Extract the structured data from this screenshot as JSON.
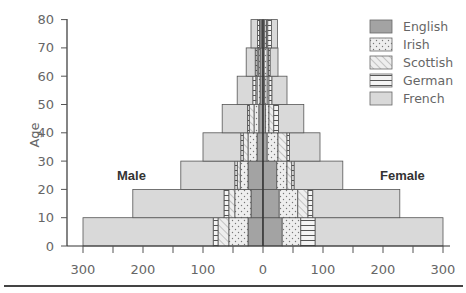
{
  "chart_data": {
    "type": "bar",
    "subtype": "population-pyramid (stacked horizontal bars)",
    "title": "",
    "ylabel": "Age",
    "xlabel": "",
    "side_labels": {
      "left": "Male",
      "right": "Female"
    },
    "categories": [
      "0-10",
      "10-20",
      "20-30",
      "30-40",
      "40-50",
      "50-60",
      "60-70",
      "70-80"
    ],
    "y_ticks": [
      0,
      10,
      20,
      30,
      40,
      50,
      60,
      70,
      80
    ],
    "x_ticks": [
      300,
      200,
      100,
      0,
      100,
      200,
      300
    ],
    "xlim": [
      -300,
      300
    ],
    "ylim": [
      0,
      80
    ],
    "grid": false,
    "legend_position": "top-right",
    "stack_order_from_center": [
      "English",
      "Irish",
      "Scottish",
      "German",
      "French"
    ],
    "series": [
      {
        "name": "English",
        "pattern": "solid-dark",
        "color": "#a0a0a0",
        "male": [
          25,
          20,
          25,
          10,
          7,
          5,
          5,
          3
        ],
        "female": [
          32,
          27,
          23,
          7,
          4,
          3,
          2,
          3
        ]
      },
      {
        "name": "Irish",
        "pattern": "dots",
        "color": "#e6e6e6",
        "male": [
          32,
          27,
          13,
          15,
          8,
          5,
          3,
          2
        ],
        "female": [
          31,
          31,
          17,
          18,
          6,
          4,
          5,
          3
        ]
      },
      {
        "name": "Scottish",
        "pattern": "diagonal-hatch",
        "color": "#e6e6e6",
        "male": [
          18,
          10,
          5,
          8,
          8,
          2,
          2,
          1
        ],
        "female": [
          0,
          17,
          8,
          15,
          8,
          3,
          2,
          2
        ]
      },
      {
        "name": "German",
        "pattern": "horizontal-lines",
        "color": "#ececec",
        "male": [
          8,
          8,
          4,
          4,
          3,
          5,
          3,
          3
        ],
        "female": [
          24,
          8,
          4,
          4,
          8,
          5,
          3,
          6
        ]
      },
      {
        "name": "French",
        "pattern": "solid-light",
        "color": "#d9d9d9",
        "male": [
          217,
          152,
          90,
          63,
          42,
          26,
          15,
          11
        ],
        "female": [
          213,
          145,
          81,
          51,
          42,
          25,
          13,
          10
        ]
      }
    ],
    "totals": {
      "male": [
        300,
        217,
        137,
        100,
        68,
        43,
        28,
        20
      ],
      "female": [
        300,
        228,
        133,
        95,
        68,
        40,
        25,
        24
      ]
    }
  },
  "legend": {
    "items": [
      {
        "label": "English",
        "pattern": "solid-dark"
      },
      {
        "label": "Irish",
        "pattern": "dots"
      },
      {
        "label": "Scottish",
        "pattern": "diagonal-hatch"
      },
      {
        "label": "German",
        "pattern": "horizontal-lines"
      },
      {
        "label": "French",
        "pattern": "solid-light"
      }
    ]
  },
  "axis": {
    "y_title": "Age",
    "y_tick_labels": [
      "0",
      "10",
      "20",
      "30",
      "40",
      "50",
      "60",
      "70",
      "80"
    ],
    "x_tick_labels": [
      "300",
      "200",
      "100",
      "0",
      "100",
      "200",
      "300"
    ]
  },
  "labels": {
    "male": "Male",
    "female": "Female"
  }
}
